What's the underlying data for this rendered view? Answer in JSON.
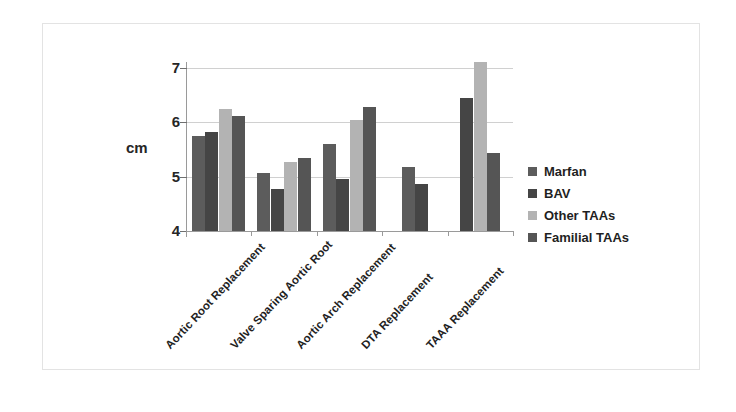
{
  "chart_data": {
    "type": "bar",
    "title": "",
    "subtitle": "",
    "xlabel": "",
    "ylabel": "cm",
    "ylim": [
      4,
      7.4
    ],
    "yticks": [
      4,
      5,
      6,
      7
    ],
    "ytick_labels": [
      "4",
      "5",
      "6",
      "7"
    ],
    "grid": true,
    "legend_position": "right",
    "categories": [
      "Aortic Root Replacement",
      "Valve Sparing Aortic Root",
      "Aortic Arch Replacement",
      "DTA Replacement",
      "TAAA Replacement"
    ],
    "series": [
      {
        "name": "Marfan",
        "color": "#5c5c5c",
        "values": [
          5.75,
          5.07,
          5.6,
          5.17,
          null
        ]
      },
      {
        "name": "BAV",
        "color": "#454545",
        "values": [
          5.82,
          4.78,
          4.95,
          4.87,
          6.45
        ]
      },
      {
        "name": "Other TAAs",
        "color": "#b3b3b3",
        "values": [
          6.25,
          5.28,
          6.05,
          null,
          7.12
        ]
      },
      {
        "name": "Familial TAAs",
        "color": "#555555",
        "values": [
          6.12,
          5.35,
          6.28,
          null,
          5.43
        ]
      }
    ]
  },
  "legend": {
    "items": [
      {
        "label": "Marfan",
        "color": "#5c5c5c"
      },
      {
        "label": "BAV",
        "color": "#454545"
      },
      {
        "label": "Other TAAs",
        "color": "#b3b3b3"
      },
      {
        "label": "Familial TAAs",
        "color": "#555555"
      }
    ]
  },
  "axis": {
    "y_title": "cm"
  }
}
